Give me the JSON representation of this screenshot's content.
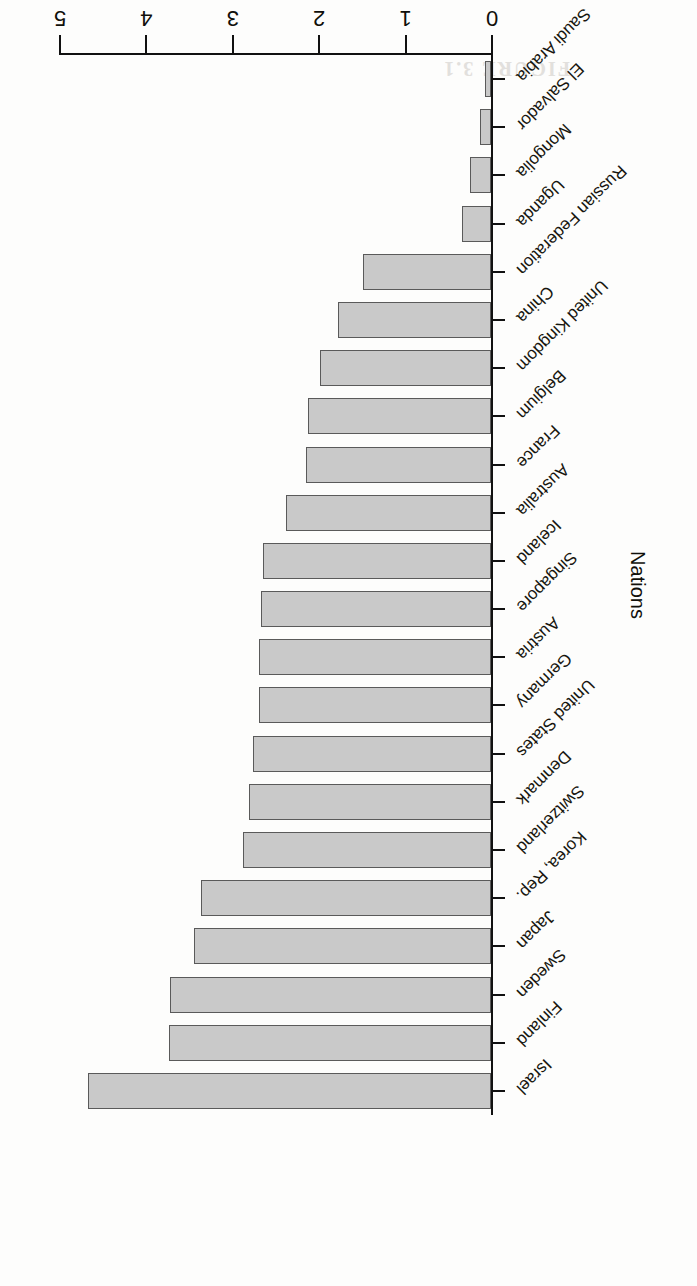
{
  "chart_data": {
    "type": "bar",
    "orientation": "horizontal",
    "title": "",
    "xlabel": "Nations",
    "ylabel": "Percentage of GDP spent on R&D",
    "ylim": [
      0,
      5
    ],
    "ytick_labels": [
      "0",
      "1",
      "2",
      "3",
      "4",
      "5"
    ],
    "ytick_values": [
      0,
      1,
      2,
      3,
      4,
      5
    ],
    "grid": false,
    "legend": null,
    "categories": [
      "Israel",
      "Finland",
      "Sweden",
      "Japan",
      "Korea, Rep.",
      "Switzerland",
      "Denmark",
      "United States",
      "Germany",
      "Austria",
      "Singapore",
      "Iceland",
      "Australia",
      "France",
      "Belgium",
      "United Kingdom",
      "China",
      "Russian Federation",
      "Uganda",
      "Mongolia",
      "El Salvador",
      "Saudi Arabia"
    ],
    "values": [
      4.66,
      3.73,
      3.72,
      3.44,
      3.36,
      2.87,
      2.8,
      2.76,
      2.69,
      2.68,
      2.66,
      2.64,
      2.37,
      2.14,
      2.12,
      1.98,
      1.77,
      1.48,
      0.33,
      0.24,
      0.13,
      0.07
    ],
    "bar_fill_color": "#c9c9c9",
    "bar_edge_color": "#5a5a5a",
    "axis_color": "#111111"
  },
  "page": {
    "bleed_text": "FIGURE 3.1"
  }
}
